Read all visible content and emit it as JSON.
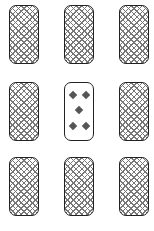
{
  "game": {
    "grid": {
      "rows": 3,
      "cols": 3
    },
    "cards": [
      {
        "row": 0,
        "col": 0,
        "face": "down",
        "pattern": "crosshatch"
      },
      {
        "row": 0,
        "col": 1,
        "face": "down",
        "pattern": "crosshatch"
      },
      {
        "row": 0,
        "col": 2,
        "face": "down",
        "pattern": "crosshatch"
      },
      {
        "row": 1,
        "col": 0,
        "face": "down",
        "pattern": "crosshatch"
      },
      {
        "row": 1,
        "col": 1,
        "face": "up",
        "rank": "5",
        "suit": "diamonds",
        "pip_count": 5
      },
      {
        "row": 1,
        "col": 2,
        "face": "down",
        "pattern": "crosshatch"
      },
      {
        "row": 2,
        "col": 0,
        "face": "down",
        "pattern": "crosshatch"
      },
      {
        "row": 2,
        "col": 1,
        "face": "down",
        "pattern": "crosshatch"
      },
      {
        "row": 2,
        "col": 2,
        "face": "down",
        "pattern": "crosshatch"
      }
    ],
    "colors": {
      "border": "#222222",
      "hatch": "#777777",
      "pip": "#555555",
      "background": "#ffffff"
    }
  }
}
